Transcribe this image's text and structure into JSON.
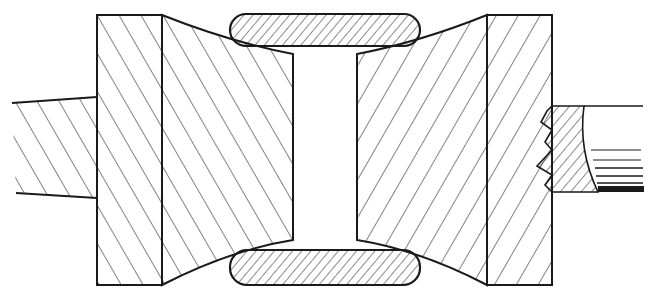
{
  "diagram": {
    "type": "cross-section line drawing",
    "colors": {
      "ink": "#1a1a1a",
      "background": "#ffffff"
    },
    "parts": [
      {
        "id": "left-shaft",
        "label": "Left shaft (hatched)"
      },
      {
        "id": "left-flange",
        "label": "Left flange collar (hatched)"
      },
      {
        "id": "left-roll",
        "label": "Left tapered roll (hatched)"
      },
      {
        "id": "right-roll",
        "label": "Right tapered roll (hatched)"
      },
      {
        "id": "right-flange",
        "label": "Right flange collar (hatched)"
      },
      {
        "id": "right-shaft",
        "label": "Right shaft with broken end"
      },
      {
        "id": "top-workpiece",
        "label": "Top rounded bar (hatched)"
      },
      {
        "id": "bottom-workpiece",
        "label": "Bottom rounded bar (hatched)"
      }
    ],
    "text_labels": []
  }
}
